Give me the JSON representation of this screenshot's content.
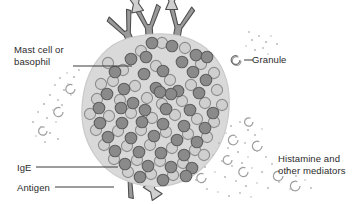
{
  "figure": {
    "width": 361,
    "height": 204,
    "background": "#ffffff"
  },
  "labels": {
    "mast_cell": "Mast cell or\nbasophil",
    "granule": "Granule",
    "histamine": "Histamine and\nother mediators",
    "ige": "IgE",
    "antigen": "Antigen"
  },
  "colors": {
    "text": "#2b2b2b",
    "leader_line": "#3a3a3a",
    "cell_fill": "#d9d9d9",
    "cell_stroke": "#c3c3c3",
    "granule_dark_fill": "#8a8a8a",
    "granule_dark_stroke": "#5e5e5e",
    "granule_light_fill": "#cfcfcf",
    "granule_light_stroke": "#8a8a8a",
    "antibody_fill": "#9a9a9a",
    "antibody_stroke": "#4f4f4f",
    "antigen_fill": "#d0d0d0",
    "antigen_stroke": "#4f4f4f",
    "mediator_dot": "#b6b6b6",
    "released_granule_stroke": "#9a9a9a"
  },
  "icons": {
    "granule_legend": "open-circle-granule-icon",
    "cell": "mast-cell-body",
    "antibody": "ige-antibody-y-shape",
    "antigen": "antigen-bowtie-shape",
    "released_granule": "released-granule-icon",
    "mediator_cloud": "histamine-mediator-dots"
  },
  "diagram_data": {
    "type": "biological-schematic",
    "subject": "Mast cell or basophil degranulation releasing histamine and other mediators",
    "cell": {
      "center_x": 155,
      "center_y": 110,
      "radius_x": 72,
      "radius_y": 76
    },
    "granule_counts": {
      "dark_internal": 48,
      "light_internal": 47,
      "released_external": 12
    },
    "antibodies": [
      {
        "name": "ige-antibody-top-left",
        "x": 126,
        "y": 30,
        "angle": -20,
        "antigen_bound": false
      },
      {
        "name": "ige-antibody-top-mid",
        "x": 146,
        "y": 16,
        "angle": 0,
        "antigen_bound": true
      },
      {
        "name": "ige-antibody-top-right",
        "x": 172,
        "y": 12,
        "angle": 8,
        "antigen_bound": true
      },
      {
        "name": "ige-antibody-bottom",
        "x": 122,
        "y": 176,
        "angle": 150,
        "antigen_bound": true
      }
    ],
    "leader_lines": [
      {
        "name": "mast-cell-leader",
        "from": [
          73,
          66
        ],
        "to": [
          128,
          66
        ]
      },
      {
        "name": "granule-leader",
        "from": [
          243,
          60
        ],
        "to": [
          252,
          60
        ]
      },
      {
        "name": "ige-leader",
        "from": [
          36,
          167
        ],
        "to": [
          118,
          167
        ]
      },
      {
        "name": "antigen-leader",
        "from": [
          54,
          187
        ],
        "to": [
          116,
          187
        ]
      }
    ]
  }
}
